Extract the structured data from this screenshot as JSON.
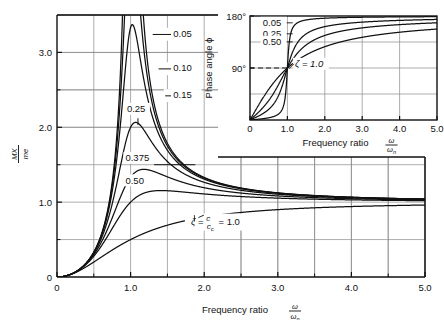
{
  "figure": {
    "background": "#ffffff",
    "line_color": "#111111",
    "grid_color": "#8a8a8a"
  },
  "main_chart": {
    "xlabel_prefix": "Frequency ratio",
    "xlabel_num": "ω",
    "xlabel_den": "ω",
    "xlabel_den_sub": "n",
    "ylabel_num": "MX",
    "ylabel_den": "me",
    "xticks": [
      "0",
      "1.0",
      "2.0",
      "3.0",
      "4.0",
      "5.0"
    ],
    "xtick_values": [
      0,
      1,
      2,
      3,
      4,
      5
    ],
    "yticks": [
      "1.0",
      "2.0",
      "3.0"
    ],
    "ytick_values": [
      1,
      2,
      3
    ],
    "xlim": [
      0,
      5
    ],
    "ylim": [
      0,
      3.5
    ],
    "grid": "on",
    "grid_x_step": 0.5,
    "grid_y_step": 0.5,
    "curve_labels": [
      {
        "text": "0.05",
        "x": 1.62,
        "y": 3.22
      },
      {
        "text": "0.10",
        "x": 1.62,
        "y": 2.76
      },
      {
        "text": "0.15",
        "x": 1.62,
        "y": 2.4
      },
      {
        "text": "0.25",
        "x": 1.08,
        "y": 2.18
      },
      {
        "text": "0.375",
        "x": 1.1,
        "y": 1.5
      },
      {
        "text": "0.50",
        "x": 1.1,
        "y": 1.22
      }
    ],
    "zeta_annotation": "ζ = c/cᴄ = 1.0",
    "zeta_annotation_parts": {
      "zeta": "ζ",
      "eq1": "=",
      "num": "c",
      "den": "c",
      "den_sub": "c",
      "eq2": "= 1.0"
    }
  },
  "inset_chart": {
    "ylabel": "Phase angle ϕ",
    "xlabel_prefix": "Frequency ratio",
    "xlabel_num": "ω",
    "xlabel_den": "ω",
    "xlabel_den_sub": "n",
    "yticks": [
      "180°",
      "90°"
    ],
    "ytick_values": [
      180,
      90
    ],
    "xticks": [
      "0",
      "1.0",
      "2.0",
      "3.0",
      "4.0",
      "5.0"
    ],
    "xtick_values": [
      0,
      1,
      2,
      3,
      4,
      5
    ],
    "xlim": [
      0,
      5
    ],
    "ylim": [
      0,
      180
    ],
    "grid": "on",
    "grid_x_step": 1.0,
    "grid_y_step": 45,
    "dashed_guide": "90° dashed line to ω/ωₙ = 1.0",
    "curve_labels": [
      {
        "text": "0.05",
        "x": 0.4,
        "y": 167
      },
      {
        "text": "0.25",
        "x": 0.4,
        "y": 148
      },
      {
        "text": "0.50",
        "x": 0.4,
        "y": 136
      }
    ],
    "zeta_annotation": "ζ = 1.0"
  },
  "chart_data": {
    "type": "line",
    "title": "",
    "subtitle": "",
    "charts": [
      {
        "name": "magnification-factor",
        "type": "line",
        "xlabel": "Frequency ratio ω/ωn",
        "ylabel": "MX/me",
        "xlim": [
          0,
          5
        ],
        "ylim": [
          0,
          3.5
        ],
        "xticks": [
          0,
          1,
          2,
          3,
          4,
          5
        ],
        "yticks": [
          1,
          2,
          3
        ],
        "grid": true,
        "legend": "inline curve labels",
        "formula": "MX/me = r^2 / sqrt((1-r^2)^2 + (2*zeta*r)^2)",
        "series": [
          {
            "name": "0.05",
            "zeta": 0.05,
            "peak_x": 1.005,
            "peak_y": 10.01
          },
          {
            "name": "0.10",
            "zeta": 0.1,
            "peak_x": 1.021,
            "peak_y": 5.03
          },
          {
            "name": "0.15",
            "zeta": 0.15,
            "peak_x": 1.048,
            "peak_y": 3.37
          },
          {
            "name": "0.25",
            "zeta": 0.25,
            "peak_x": 1.155,
            "peak_y": 2.07
          },
          {
            "name": "0.375",
            "zeta": 0.375,
            "peak_x": 1.455,
            "peak_y": 1.44
          },
          {
            "name": "0.50",
            "zeta": 0.5,
            "peak_x": 1.414,
            "peak_y": 1.155
          },
          {
            "name": "1.0",
            "zeta": 1.0,
            "peak_x": null,
            "peak_y": 1.0
          }
        ],
        "x_samples": [
          0,
          0.25,
          0.5,
          0.75,
          1.0,
          1.25,
          1.5,
          2.0,
          2.5,
          3.0,
          3.5,
          4.0,
          4.5,
          5.0
        ],
        "values_by_series": {
          "0.25": [
            0,
            0.066,
            0.32,
            1.003,
            2.0,
            1.543,
            1.161,
            1.0,
            1.0,
            1.024,
            1.024,
            1.02,
            1.017,
            1.014
          ],
          "0.375": [
            0,
            0.066,
            0.314,
            0.897,
            1.333,
            1.394,
            1.236,
            1.044,
            1.02,
            1.013,
            1.009,
            1.007,
            1.005,
            1.004
          ],
          "0.50": [
            0,
            0.066,
            0.307,
            0.792,
            1.0,
            1.123,
            1.138,
            1.054,
            1.023,
            1.012,
            1.007,
            1.005,
            1.004,
            1.003
          ],
          "1.0": [
            0,
            0.062,
            0.25,
            0.494,
            0.5,
            0.686,
            0.773,
            0.889,
            0.936,
            0.96,
            0.973,
            0.98,
            0.984,
            0.988
          ]
        }
      },
      {
        "name": "phase-angle",
        "type": "line",
        "xlabel": "Frequency ratio ω/ωn",
        "ylabel": "Phase angle ϕ",
        "xlim": [
          0,
          5
        ],
        "ylim": [
          0,
          180
        ],
        "xticks": [
          0,
          1,
          2,
          3,
          4,
          5
        ],
        "yticks": [
          90,
          180
        ],
        "grid": true,
        "formula": "phi = atan(2*zeta*r/(1-r^2))",
        "series": [
          {
            "name": "0.05",
            "zeta": 0.05
          },
          {
            "name": "0.25",
            "zeta": 0.25
          },
          {
            "name": "0.50",
            "zeta": 0.5
          },
          {
            "name": "1.0",
            "zeta": 1.0
          }
        ],
        "crossover": {
          "x": 1.0,
          "y": 90
        }
      }
    ]
  }
}
